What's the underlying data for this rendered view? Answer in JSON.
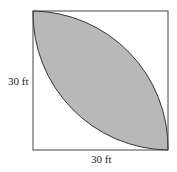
{
  "diagram": {
    "shape": "square with two quarter-circle arcs forming shaded lens",
    "labels": {
      "left_side": "30 ft",
      "bottom_side": "30 ft"
    },
    "colors": {
      "fill": "#b8b8b8",
      "stroke": "#333333",
      "background": "#ffffff"
    }
  }
}
